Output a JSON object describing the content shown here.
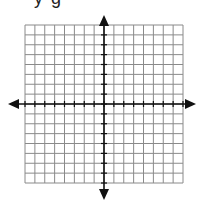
{
  "header": {
    "partial_text": "y-g"
  },
  "grid": {
    "left": 25,
    "top": 25,
    "right": 183,
    "bottom": 183,
    "cells_x": 16,
    "cells_y": 16,
    "line_color": "#8a8a8a",
    "axis_color": "#111111"
  },
  "axes": {
    "origin_x": 104,
    "origin_y": 104,
    "x_arrow_left": 8,
    "x_arrow_right": 196,
    "y_arrow_top": 15,
    "y_arrow_bottom": 200
  }
}
